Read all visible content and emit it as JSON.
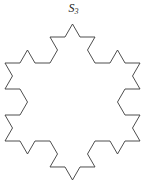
{
  "figure": {
    "label_symbol": "S",
    "label_subscript": "3",
    "label_full": "S3",
    "caption": "",
    "background_color": "#ffffff",
    "stroke_color": "#3a3a3a",
    "stroke_width": 0.9,
    "fill": "none",
    "canvas": {
      "width": 147,
      "height": 187
    }
  },
  "chart_data": {
    "type": "line",
    "title": "S3",
    "subtitle": "",
    "shape": "koch-snowflake",
    "iteration": 2,
    "sequence_index": 3,
    "segment_count": 48,
    "vertex_count": 48,
    "grid": false,
    "legend": null,
    "xlabel": "",
    "ylabel": "",
    "axes_visible": false,
    "base_polygon": {
      "name": "equilateral-triangle",
      "orientation": "point-up",
      "sides": 3,
      "vertices": [
        {
          "x": 72.5,
          "y": 24.0
        },
        {
          "x": 140.0,
          "y": 141.0
        },
        {
          "x": 5.0,
          "y": 141.0
        }
      ]
    },
    "bounds": {
      "xmin": 11,
      "xmax": 133,
      "ymin": 24,
      "ymax": 182
    },
    "annotations": [
      {
        "text": "S3",
        "x": 73,
        "y": 10,
        "role": "figure-label"
      }
    ]
  }
}
